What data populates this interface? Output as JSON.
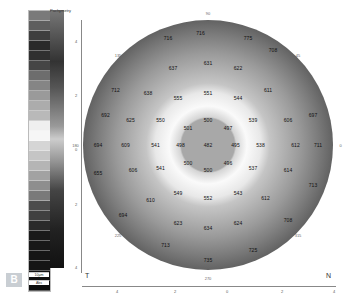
{
  "scale": {
    "title": "Pachymetry",
    "swatches": [
      "#7a7a7a",
      "#5e5e5e",
      "#3e3e3e",
      "#2a2a2a",
      "#303030",
      "#454545",
      "#6d6d6d",
      "#858585",
      "#9a9a9a",
      "#acacac",
      "#b9b9b9",
      "#efefef",
      "#f6f6f6",
      "#d5d5d5",
      "#c5c5c5",
      "#b5b5b5",
      "#a2a2a2",
      "#8e8e8e",
      "#7a7a7a",
      "#4c4c4c",
      "#404040",
      "#2a2a2a",
      "#1a1a1a",
      "#181818",
      "#151515",
      "#151515",
      "#101010",
      "#0d0d0d"
    ],
    "unit_primary": "10µm",
    "unit_secondary": "Abs"
  },
  "panel_label": "B",
  "map": {
    "corner_label": "T",
    "right_label": "N",
    "values": [
      {
        "v": "482",
        "x": 50,
        "y": 50
      },
      {
        "v": "500",
        "x": 50,
        "y": 40
      },
      {
        "v": "497",
        "x": 58,
        "y": 43
      },
      {
        "v": "495",
        "x": 61,
        "y": 50
      },
      {
        "v": "496",
        "x": 58,
        "y": 57
      },
      {
        "v": "500",
        "x": 50,
        "y": 60
      },
      {
        "v": "500",
        "x": 42,
        "y": 57
      },
      {
        "v": "498",
        "x": 39,
        "y": 50
      },
      {
        "v": "501",
        "x": 42,
        "y": 43
      },
      {
        "v": "551",
        "x": 50,
        "y": 29
      },
      {
        "v": "544",
        "x": 62,
        "y": 31
      },
      {
        "v": "539",
        "x": 68,
        "y": 40
      },
      {
        "v": "538",
        "x": 71,
        "y": 50
      },
      {
        "v": "537",
        "x": 68,
        "y": 59
      },
      {
        "v": "543",
        "x": 62,
        "y": 69
      },
      {
        "v": "552",
        "x": 50,
        "y": 71
      },
      {
        "v": "549",
        "x": 38,
        "y": 69
      },
      {
        "v": "541",
        "x": 31,
        "y": 59
      },
      {
        "v": "541",
        "x": 29,
        "y": 50
      },
      {
        "v": "550",
        "x": 31,
        "y": 40
      },
      {
        "v": "555",
        "x": 38,
        "y": 31
      },
      {
        "v": "631",
        "x": 50,
        "y": 17
      },
      {
        "v": "622",
        "x": 62,
        "y": 19
      },
      {
        "v": "611",
        "x": 74,
        "y": 28
      },
      {
        "v": "606",
        "x": 82,
        "y": 40
      },
      {
        "v": "612",
        "x": 85,
        "y": 50
      },
      {
        "v": "614",
        "x": 82,
        "y": 60
      },
      {
        "v": "612",
        "x": 73,
        "y": 71
      },
      {
        "v": "624",
        "x": 62,
        "y": 81
      },
      {
        "v": "634",
        "x": 50,
        "y": 83
      },
      {
        "v": "623",
        "x": 38,
        "y": 81
      },
      {
        "v": "610",
        "x": 27,
        "y": 72
      },
      {
        "v": "606",
        "x": 20,
        "y": 60
      },
      {
        "v": "609",
        "x": 17,
        "y": 50
      },
      {
        "v": "625",
        "x": 19,
        "y": 40
      },
      {
        "v": "638",
        "x": 26,
        "y": 29
      },
      {
        "v": "637",
        "x": 36,
        "y": 19
      },
      {
        "v": "716",
        "x": 34,
        "y": 7
      },
      {
        "v": "716",
        "x": 47,
        "y": 5
      },
      {
        "v": "775",
        "x": 66,
        "y": 7
      },
      {
        "v": "708",
        "x": 76,
        "y": 12
      },
      {
        "v": "697",
        "x": 92,
        "y": 38
      },
      {
        "v": "711",
        "x": 94,
        "y": 50
      },
      {
        "v": "713",
        "x": 92,
        "y": 66
      },
      {
        "v": "708",
        "x": 82,
        "y": 80
      },
      {
        "v": "725",
        "x": 68,
        "y": 92
      },
      {
        "v": "735",
        "x": 50,
        "y": 96
      },
      {
        "v": "713",
        "x": 33,
        "y": 90
      },
      {
        "v": "694",
        "x": 16,
        "y": 78
      },
      {
        "v": "694",
        "x": 6,
        "y": 50
      },
      {
        "v": "655",
        "x": 6,
        "y": 61
      },
      {
        "v": "692",
        "x": 9,
        "y": 38
      },
      {
        "v": "712",
        "x": 13,
        "y": 28
      }
    ],
    "degrees": [
      {
        "v": "90",
        "x": 50,
        "y": -3
      },
      {
        "v": "135",
        "x": 14,
        "y": 14
      },
      {
        "v": "45",
        "x": 86,
        "y": 14
      },
      {
        "v": "0",
        "x": 103,
        "y": 50
      },
      {
        "v": "180",
        "x": -3,
        "y": 50
      },
      {
        "v": "225",
        "x": 14,
        "y": 86
      },
      {
        "v": "315",
        "x": 86,
        "y": 86
      },
      {
        "v": "270",
        "x": 50,
        "y": 103
      }
    ]
  },
  "axes": {
    "x_ticks": [
      {
        "v": "4",
        "x": 118
      },
      {
        "v": "2",
        "x": 176
      },
      {
        "v": "0",
        "x": 228
      },
      {
        "v": "2",
        "x": 283
      },
      {
        "v": "4",
        "x": 335
      }
    ],
    "y_ticks": [
      {
        "v": "4",
        "y": 42
      },
      {
        "v": "2",
        "y": 96
      },
      {
        "v": "0",
        "y": 150
      },
      {
        "v": "2",
        "y": 205
      },
      {
        "v": "4",
        "y": 268
      }
    ]
  }
}
